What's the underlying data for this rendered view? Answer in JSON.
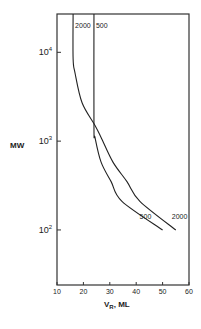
{
  "chart_data": {
    "type": "line",
    "title": "",
    "xlabel": "V",
    "xlabel_sub": "R",
    "xlabel_suffix": ", ML",
    "ylabel": "MW",
    "xscale": "linear",
    "yscale": "log",
    "xlim": [
      10,
      60
    ],
    "ylim": [
      24,
      27000
    ],
    "xticks": [
      10,
      20,
      30,
      40,
      50,
      60
    ],
    "xtick_labels": [
      "10",
      "20",
      "30",
      "40",
      "50",
      "60"
    ],
    "yticks": [
      100,
      1000,
      10000
    ],
    "ytick_labels": [
      {
        "base": "10",
        "exp": "2"
      },
      {
        "base": "10",
        "exp": "3"
      },
      {
        "base": "10",
        "exp": "4"
      }
    ],
    "grid": false,
    "series": [
      {
        "name": "2000",
        "top_label": "2000",
        "end_label": "2000",
        "points": [
          [
            16.1,
            27000
          ],
          [
            16.1,
            8500
          ],
          [
            16.8,
            5900
          ],
          [
            19.5,
            2700
          ],
          [
            24.4,
            1500
          ],
          [
            26.7,
            1100
          ],
          [
            31.2,
            580
          ],
          [
            36.5,
            350
          ],
          [
            41.4,
            210
          ],
          [
            55,
            100
          ]
        ]
      },
      {
        "name": "500",
        "top_label": "500",
        "end_label": "500",
        "points": [
          [
            24,
            27000
          ],
          [
            24,
            1450
          ],
          [
            24.4,
            1100
          ],
          [
            26.7,
            580
          ],
          [
            30.5,
            350
          ],
          [
            34.6,
            210
          ],
          [
            50,
            100
          ]
        ]
      }
    ]
  }
}
